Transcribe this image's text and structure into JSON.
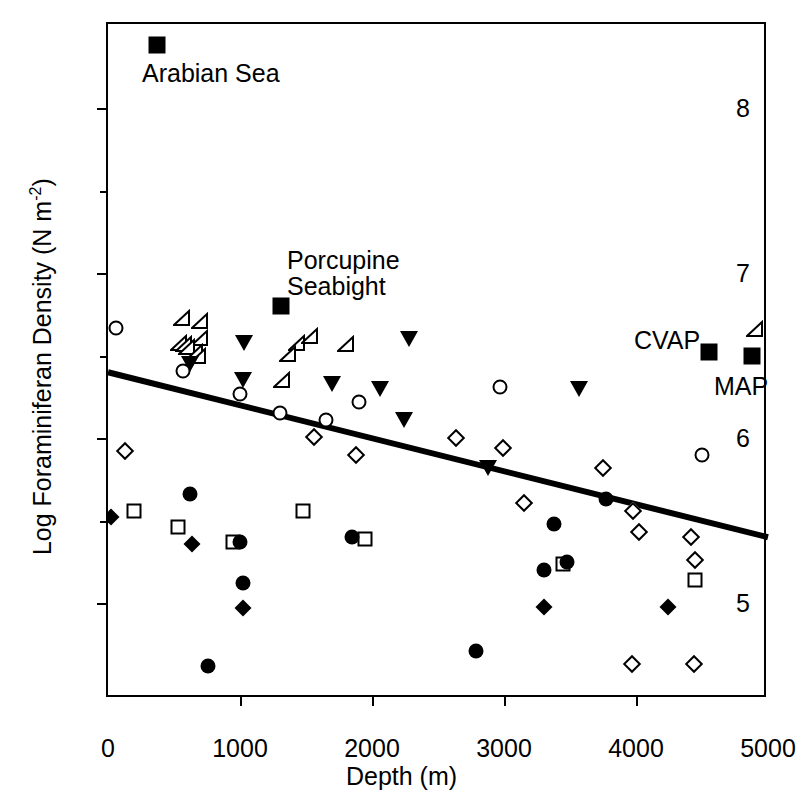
{
  "chart_data": {
    "type": "scatter",
    "title": "",
    "xlabel": "Depth (m)",
    "ylabel_text": "Log Foraminiferan Density (N m",
    "ylabel_exponent": "-2",
    "ylabel_close": ")",
    "xlim": [
      0,
      5000
    ],
    "ylim": [
      4.42,
      8.51
    ],
    "grid": false,
    "legend": "none",
    "xticks": [
      0,
      1000,
      2000,
      3000,
      4000,
      5000
    ],
    "xtick_labels": [
      "0",
      "1000",
      "2000",
      "3000",
      "4000",
      "5000"
    ],
    "yticks": [
      5,
      6,
      7,
      8
    ],
    "ytick_labels": [
      "5",
      "6",
      "7",
      "8"
    ],
    "yminor_ticks": [
      5.5,
      6.5,
      7.5
    ],
    "series": [
      {
        "name": "open-left-triangle",
        "marker": "open-left-triangle",
        "points": [
          {
            "x": 560,
            "y": 6.73
          },
          {
            "x": 700,
            "y": 6.71
          },
          {
            "x": 700,
            "y": 6.61
          },
          {
            "x": 540,
            "y": 6.58
          },
          {
            "x": 575,
            "y": 6.57
          },
          {
            "x": 600,
            "y": 6.55
          },
          {
            "x": 660,
            "y": 6.52
          },
          {
            "x": 680,
            "y": 6.5
          },
          {
            "x": 1430,
            "y": 6.58
          },
          {
            "x": 1530,
            "y": 6.62
          },
          {
            "x": 1360,
            "y": 6.51
          },
          {
            "x": 1800,
            "y": 6.57
          },
          {
            "x": 1320,
            "y": 6.35
          },
          {
            "x": 4900,
            "y": 6.66
          }
        ]
      },
      {
        "name": "filled-down-triangle",
        "marker": "filled-down-triangle",
        "points": [
          {
            "x": 1030,
            "y": 6.58
          },
          {
            "x": 620,
            "y": 6.45
          },
          {
            "x": 1020,
            "y": 6.35
          },
          {
            "x": 2280,
            "y": 6.6
          },
          {
            "x": 1700,
            "y": 6.33
          },
          {
            "x": 2060,
            "y": 6.3
          },
          {
            "x": 2240,
            "y": 6.11
          },
          {
            "x": 3570,
            "y": 6.3
          },
          {
            "x": 2880,
            "y": 5.82
          }
        ]
      },
      {
        "name": "open-circle",
        "marker": "open-circle",
        "points": [
          {
            "x": 60,
            "y": 6.67
          },
          {
            "x": 570,
            "y": 6.41
          },
          {
            "x": 1000,
            "y": 6.27
          },
          {
            "x": 1300,
            "y": 6.15
          },
          {
            "x": 1650,
            "y": 6.11
          },
          {
            "x": 1900,
            "y": 6.22
          },
          {
            "x": 2970,
            "y": 6.31
          },
          {
            "x": 4500,
            "y": 5.9
          }
        ]
      },
      {
        "name": "open-square",
        "marker": "open-square",
        "points": [
          {
            "x": 200,
            "y": 5.56
          },
          {
            "x": 530,
            "y": 5.46
          },
          {
            "x": 950,
            "y": 5.37
          },
          {
            "x": 1480,
            "y": 5.56
          },
          {
            "x": 1950,
            "y": 5.39
          },
          {
            "x": 3450,
            "y": 5.24
          },
          {
            "x": 4450,
            "y": 5.14
          }
        ]
      },
      {
        "name": "filled-circle",
        "marker": "filled-circle",
        "points": [
          {
            "x": 620,
            "y": 5.66
          },
          {
            "x": 1020,
            "y": 5.12
          },
          {
            "x": 1000,
            "y": 5.37
          },
          {
            "x": 1850,
            "y": 5.4
          },
          {
            "x": 2790,
            "y": 4.71
          },
          {
            "x": 3300,
            "y": 5.2
          },
          {
            "x": 3380,
            "y": 5.48
          },
          {
            "x": 3480,
            "y": 5.25
          },
          {
            "x": 3770,
            "y": 5.63
          },
          {
            "x": 760,
            "y": 4.62
          }
        ]
      },
      {
        "name": "filled-diamond",
        "marker": "filled-diamond",
        "points": [
          {
            "x": 20,
            "y": 5.52
          },
          {
            "x": 640,
            "y": 5.36
          },
          {
            "x": 1020,
            "y": 4.97
          },
          {
            "x": 3300,
            "y": 4.98
          },
          {
            "x": 4240,
            "y": 4.98
          }
        ]
      },
      {
        "name": "open-diamond",
        "marker": "open-diamond",
        "points": [
          {
            "x": 130,
            "y": 5.92
          },
          {
            "x": 1560,
            "y": 6.01
          },
          {
            "x": 1880,
            "y": 5.9
          },
          {
            "x": 2990,
            "y": 5.94
          },
          {
            "x": 2640,
            "y": 6.0
          },
          {
            "x": 3150,
            "y": 5.61
          },
          {
            "x": 3750,
            "y": 5.82
          },
          {
            "x": 3980,
            "y": 5.56
          },
          {
            "x": 4020,
            "y": 5.43
          },
          {
            "x": 4420,
            "y": 5.4
          },
          {
            "x": 4450,
            "y": 5.26
          },
          {
            "x": 3970,
            "y": 4.63
          },
          {
            "x": 4440,
            "y": 4.63
          }
        ]
      },
      {
        "name": "filled-square-labeled",
        "marker": "filled-square",
        "points": [
          {
            "x": 370,
            "y": 8.38,
            "label": "Arabian Sea"
          },
          {
            "x": 1310,
            "y": 6.8,
            "label": "Porcupine Seabight"
          },
          {
            "x": 4550,
            "y": 6.52,
            "label": "CVAP"
          },
          {
            "x": 4880,
            "y": 6.5,
            "label": "MAP"
          }
        ]
      }
    ],
    "trendline": {
      "name": "regression-line",
      "x0": 0,
      "y0": 6.4,
      "x1": 5000,
      "y1": 5.4,
      "color": "#000000",
      "width": 6
    },
    "annotations": [
      {
        "text": "Arabian Sea",
        "x_px": 140,
        "y_px": 58,
        "align": "left"
      },
      {
        "text": "Porcupine\nSeabight",
        "x_px": 285,
        "y_px": 245,
        "align": "left"
      },
      {
        "text": "CVAP",
        "x_px": 632,
        "y_px": 325,
        "align": "left"
      },
      {
        "text": "MAP",
        "x_px": 712,
        "y_px": 371,
        "align": "left"
      }
    ]
  }
}
